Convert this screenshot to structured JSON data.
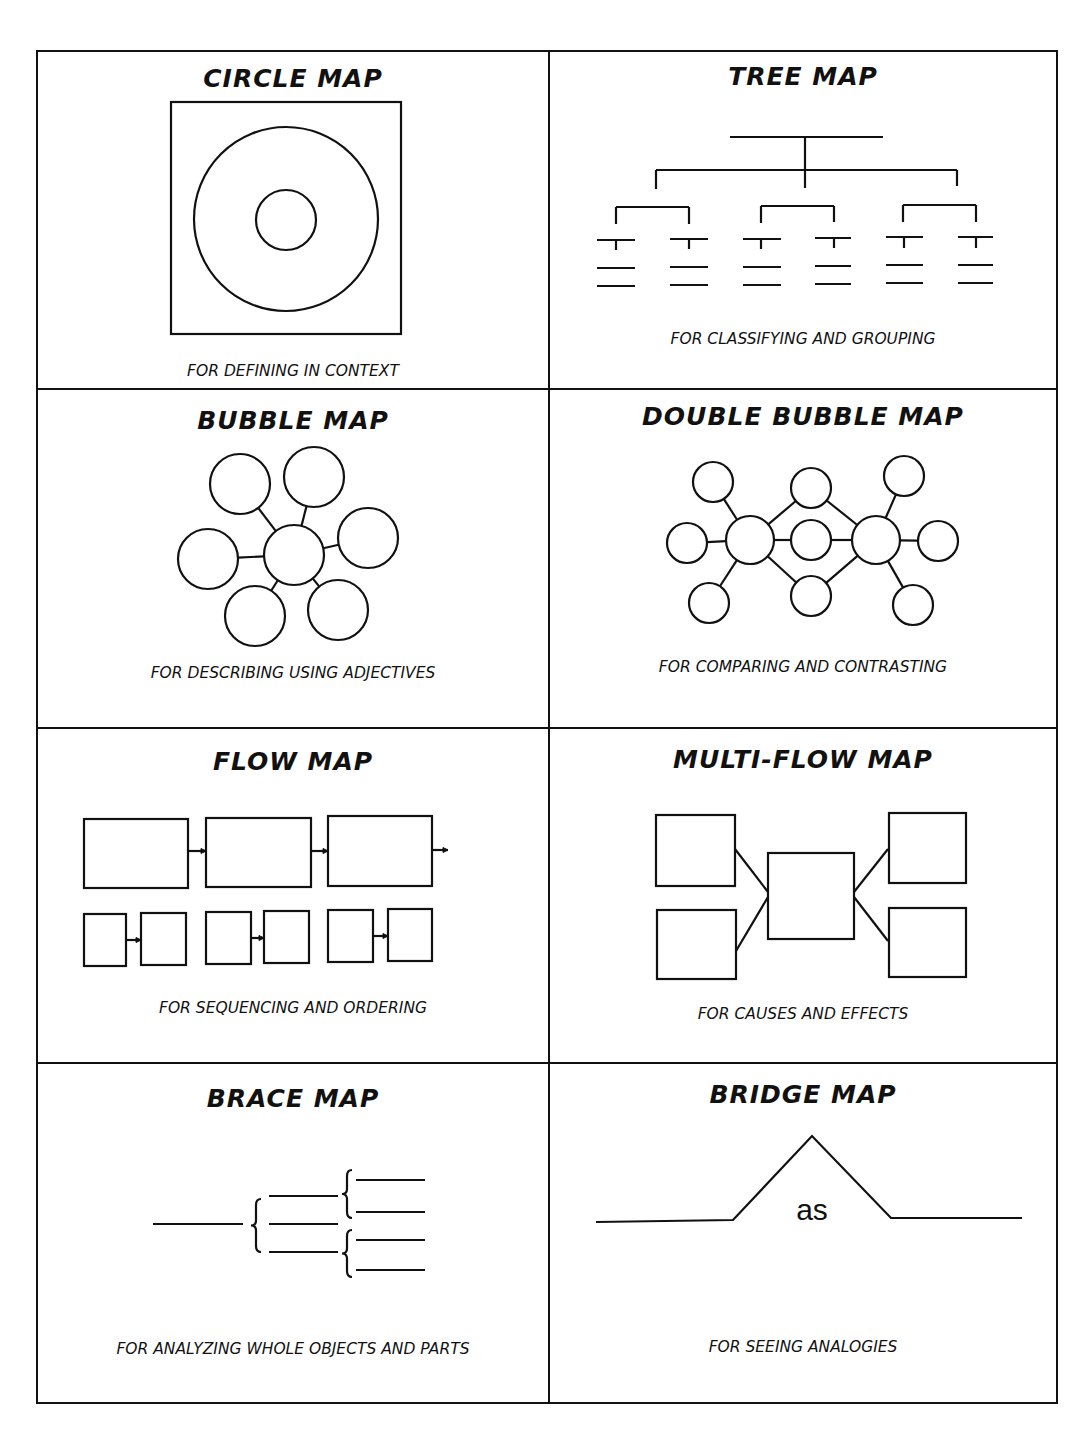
{
  "document": {
    "type": "thinking-maps-reference-sheet",
    "colors": {
      "ink": "#111111",
      "paper": "#ffffff"
    }
  },
  "panels": [
    {
      "id": "circle",
      "title": "CIRCLE MAP",
      "caption": "FOR DEFINING IN CONTEXT",
      "title_top": 12,
      "caption_top": 310,
      "shapes": {
        "rects": [
          {
            "x": 133,
            "y": 50,
            "w": 230,
            "h": 232
          }
        ],
        "circles": [
          {
            "cx": 248,
            "cy": 167,
            "r": 92
          },
          {
            "cx": 248,
            "cy": 168,
            "r": 30
          }
        ]
      }
    },
    {
      "id": "tree",
      "title": "TREE MAP",
      "caption": "FOR CLASSIFYING AND GROUPING",
      "title_top": 10,
      "caption_top": 278,
      "shapes": {
        "lines": [
          [
            180,
            85,
            333,
            85
          ],
          [
            255,
            85,
            255,
            136
          ],
          [
            106,
            118,
            106,
            137
          ],
          [
            106,
            118,
            407,
            118
          ],
          [
            407,
            118,
            407,
            134
          ],
          [
            66,
            155,
            66,
            172
          ],
          [
            66,
            155,
            139,
            155
          ],
          [
            139,
            155,
            139,
            172
          ],
          [
            211,
            154,
            211,
            171
          ],
          [
            211,
            154,
            284,
            154
          ],
          [
            284,
            154,
            284,
            170
          ],
          [
            353,
            153,
            353,
            170
          ],
          [
            353,
            153,
            426,
            153
          ],
          [
            426,
            153,
            426,
            170
          ],
          [
            47,
            188,
            85,
            188
          ],
          [
            66,
            188,
            66,
            198
          ],
          [
            47,
            216,
            85,
            216
          ],
          [
            47,
            234,
            85,
            234
          ],
          [
            120,
            187,
            158,
            187
          ],
          [
            139,
            187,
            139,
            197
          ],
          [
            120,
            215,
            158,
            215
          ],
          [
            120,
            233,
            158,
            233
          ],
          [
            193,
            187,
            231,
            187
          ],
          [
            211,
            187,
            211,
            197
          ],
          [
            193,
            215,
            231,
            215
          ],
          [
            193,
            233,
            231,
            233
          ],
          [
            265,
            186,
            301,
            186
          ],
          [
            284,
            186,
            284,
            196
          ],
          [
            265,
            214,
            301,
            214
          ],
          [
            265,
            232,
            301,
            232
          ],
          [
            336,
            185,
            373,
            185
          ],
          [
            354,
            185,
            354,
            196
          ],
          [
            336,
            213,
            373,
            213
          ],
          [
            336,
            231,
            373,
            231
          ],
          [
            408,
            185,
            443,
            185
          ],
          [
            426,
            185,
            426,
            196
          ],
          [
            408,
            213,
            443,
            213
          ],
          [
            408,
            231,
            443,
            231
          ]
        ]
      }
    },
    {
      "id": "bubble",
      "title": "BUBBLE MAP",
      "caption": "FOR DESCRIBING USING ADJECTIVES",
      "title_top": 16,
      "caption_top": 274,
      "shapes": {
        "center": {
          "cx": 256,
          "cy": 165,
          "r": 30
        },
        "bubbles": [
          {
            "cx": 202,
            "cy": 94,
            "r": 30
          },
          {
            "cx": 276,
            "cy": 87,
            "r": 30
          },
          {
            "cx": 330,
            "cy": 148,
            "r": 30
          },
          {
            "cx": 170,
            "cy": 169,
            "r": 30
          },
          {
            "cx": 217,
            "cy": 226,
            "r": 30
          },
          {
            "cx": 300,
            "cy": 220,
            "r": 30
          }
        ]
      }
    },
    {
      "id": "double-bubble",
      "title": "DOUBLE BUBBLE MAP",
      "caption": "FOR COMPARING AND CONTRASTING",
      "title_top": 12,
      "caption_top": 268,
      "shapes": {
        "centers": [
          {
            "cx": 200,
            "cy": 150,
            "r": 24
          },
          {
            "cx": 326,
            "cy": 150,
            "r": 24
          }
        ],
        "shared": [
          {
            "cx": 261,
            "cy": 98,
            "r": 20
          },
          {
            "cx": 261,
            "cy": 150,
            "r": 20
          },
          {
            "cx": 261,
            "cy": 206,
            "r": 20
          }
        ],
        "left": [
          {
            "cx": 163,
            "cy": 92,
            "r": 20
          },
          {
            "cx": 137,
            "cy": 153,
            "r": 20
          },
          {
            "cx": 159,
            "cy": 213,
            "r": 20
          }
        ],
        "right": [
          {
            "cx": 354,
            "cy": 86,
            "r": 20
          },
          {
            "cx": 388,
            "cy": 151,
            "r": 20
          },
          {
            "cx": 363,
            "cy": 215,
            "r": 20
          }
        ]
      }
    },
    {
      "id": "flow",
      "title": "FLOW MAP",
      "caption": "FOR SEQUENCING AND ORDERING",
      "title_top": 18,
      "caption_top": 270,
      "shapes": {
        "top_row": [
          {
            "x": 46,
            "y": 90,
            "w": 104,
            "h": 69
          },
          {
            "x": 168,
            "y": 89,
            "w": 105,
            "h": 69
          },
          {
            "x": 290,
            "y": 87,
            "w": 104,
            "h": 70
          }
        ],
        "bottom_row": [
          {
            "x": 46,
            "y": 185,
            "w": 42,
            "h": 52
          },
          {
            "x": 103,
            "y": 184,
            "w": 45,
            "h": 52
          },
          {
            "x": 168,
            "y": 183,
            "w": 45,
            "h": 52
          },
          {
            "x": 226,
            "y": 182,
            "w": 45,
            "h": 52
          },
          {
            "x": 290,
            "y": 181,
            "w": 45,
            "h": 52
          },
          {
            "x": 350,
            "y": 180,
            "w": 44,
            "h": 52
          }
        ],
        "arrows": [
          [
            150,
            122,
            168,
            122
          ],
          [
            273,
            122,
            290,
            122
          ],
          [
            394,
            121,
            410,
            121
          ],
          [
            88,
            211,
            103,
            211
          ],
          [
            213,
            209,
            226,
            209
          ],
          [
            335,
            207,
            350,
            207
          ]
        ]
      }
    },
    {
      "id": "multi-flow",
      "title": "MULTI-FLOW MAP",
      "caption": "FOR CAUSES AND EFFECTS",
      "title_top": 16,
      "caption_top": 276,
      "shapes": {
        "causes": [
          {
            "x": 106,
            "y": 86,
            "w": 79,
            "h": 71
          },
          {
            "x": 107,
            "y": 181,
            "w": 79,
            "h": 69
          }
        ],
        "event": {
          "x": 218,
          "y": 124,
          "w": 86,
          "h": 86
        },
        "effects": [
          {
            "x": 339,
            "y": 84,
            "w": 77,
            "h": 70
          },
          {
            "x": 339,
            "y": 179,
            "w": 77,
            "h": 69
          }
        ],
        "links": [
          [
            185,
            120,
            218,
            163
          ],
          [
            186,
            222,
            218,
            168
          ],
          [
            304,
            163,
            338,
            120
          ],
          [
            304,
            168,
            338,
            212
          ]
        ]
      }
    },
    {
      "id": "brace",
      "title": "BRACE MAP",
      "caption": "FOR ANALYZING WHOLE OBJECTS AND PARTS",
      "title_top": 20,
      "caption_top": 276,
      "shapes": {
        "whole_line": [
          115,
          160,
          205,
          160
        ],
        "level1_braces": [
          {
            "x": 218,
            "y1": 135,
            "y2": 188
          }
        ],
        "level1_lines": [
          [
            231,
            132,
            300,
            132
          ],
          [
            231,
            160,
            300,
            160
          ],
          [
            231,
            188,
            300,
            188
          ]
        ],
        "level2_braces": [
          {
            "x": 309,
            "y1": 106,
            "y2": 154
          },
          {
            "x": 309,
            "y1": 166,
            "y2": 213
          }
        ],
        "level2_lines": [
          [
            318,
            116,
            387,
            116
          ],
          [
            318,
            148,
            387,
            148
          ],
          [
            318,
            176,
            387,
            176
          ],
          [
            318,
            206,
            387,
            206
          ]
        ]
      }
    },
    {
      "id": "bridge",
      "title": "BRIDGE MAP",
      "caption": "FOR SEEING ANALOGIES",
      "title_top": 16,
      "caption_top": 274,
      "bridge_word": "as",
      "shapes": {
        "path": [
          [
            46,
            158
          ],
          [
            183,
            156
          ],
          [
            262,
            72
          ],
          [
            341,
            154
          ],
          [
            472,
            154
          ]
        ],
        "word_pos": {
          "x": 262,
          "y": 156
        }
      }
    }
  ]
}
